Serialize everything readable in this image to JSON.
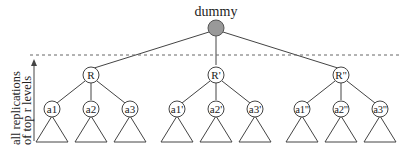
{
  "diagram": {
    "root": {
      "label": "dummy",
      "color": "#999999"
    },
    "side_label": {
      "line1": "all replications",
      "line2": "of top r levels"
    },
    "replicas": [
      {
        "label": "R",
        "children": [
          "a1",
          "a2",
          "a3"
        ]
      },
      {
        "label": "R'",
        "children": [
          "a1'",
          "a2'",
          "a3'"
        ]
      },
      {
        "label": "R''",
        "children": [
          "a1''",
          "a2''",
          "a3''"
        ]
      }
    ]
  }
}
